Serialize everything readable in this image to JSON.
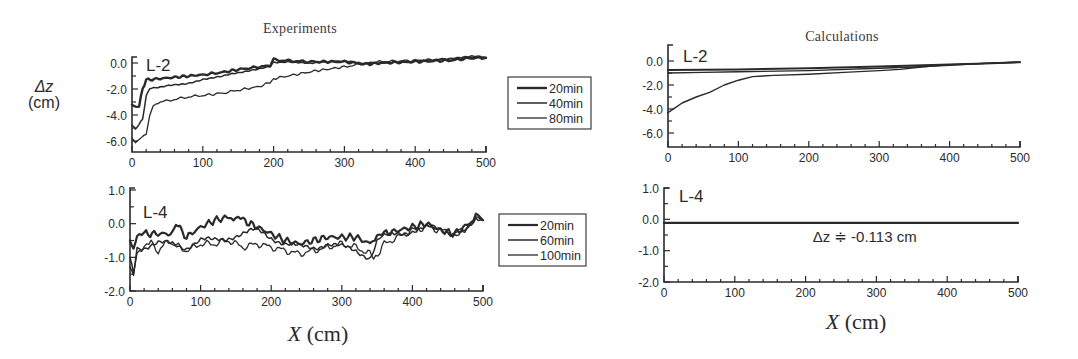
{
  "figure": {
    "columns": [
      {
        "title": "Experiments"
      },
      {
        "title": "Calculations"
      }
    ],
    "ylabel": {
      "var": "Δz",
      "unit": "(cm)"
    },
    "xlabel": {
      "var": "X",
      "unit": " (cm)"
    },
    "ink_color": "#2a2a2a"
  },
  "chart_data": [
    {
      "id": "exp-L2",
      "type": "line",
      "title": "Experiments",
      "panel_label": "L-2",
      "xlabel": "X (cm)",
      "ylabel": "Δz (cm)",
      "xlim": [
        0,
        500
      ],
      "ylim": [
        -7,
        0.4
      ],
      "xticks": [
        0,
        100,
        200,
        300,
        400,
        500
      ],
      "yticks": [
        0.0,
        -2.0,
        -4.0,
        -6.0
      ],
      "ytick_labels": [
        "0.0",
        "-2.0",
        "-4.0",
        "-6.0"
      ],
      "grid": false,
      "legend": {
        "position": "right-outside",
        "entries": [
          "20min",
          "40min",
          "80min"
        ]
      },
      "series": [
        {
          "name": "20min",
          "width": 2.4,
          "x": [
            0,
            5,
            10,
            15,
            20,
            40,
            60,
            80,
            100,
            130,
            150,
            180,
            195,
            200,
            210,
            250,
            300,
            330,
            350,
            400,
            450,
            480,
            500
          ],
          "y": [
            -3.2,
            -3.4,
            -3.3,
            -2.0,
            -1.3,
            -1.2,
            -1.1,
            -1.0,
            -0.9,
            -0.7,
            -0.5,
            -0.3,
            -0.2,
            0.3,
            0.2,
            0.1,
            0.1,
            -0.1,
            0.0,
            0.1,
            0.2,
            0.4,
            0.4
          ]
        },
        {
          "name": "40min",
          "width": 1.5,
          "x": [
            0,
            5,
            10,
            15,
            20,
            25,
            40,
            60,
            80,
            100,
            130,
            150,
            180,
            195,
            200,
            220,
            250,
            300,
            330,
            350,
            400,
            450,
            480,
            500
          ],
          "y": [
            -4.8,
            -5.0,
            -4.8,
            -4.3,
            -2.5,
            -2.0,
            -1.9,
            -1.7,
            -1.5,
            -1.3,
            -1.0,
            -0.8,
            -0.5,
            -0.3,
            0.1,
            0.1,
            0.0,
            0.1,
            -0.1,
            0.0,
            0.2,
            0.3,
            0.5,
            0.4
          ]
        },
        {
          "name": "80min",
          "width": 1.3,
          "x": [
            0,
            5,
            10,
            15,
            20,
            25,
            30,
            40,
            60,
            80,
            100,
            130,
            150,
            180,
            195,
            200,
            230,
            260,
            300,
            320,
            350,
            400,
            450,
            500
          ],
          "y": [
            -5.8,
            -6.1,
            -5.9,
            -5.6,
            -5.5,
            -4.0,
            -3.3,
            -3.0,
            -2.8,
            -2.6,
            -2.5,
            -2.3,
            -2.1,
            -1.8,
            -1.5,
            -1.2,
            -0.9,
            -0.6,
            -0.3,
            -0.1,
            0.1,
            0.2,
            0.3,
            0.4
          ]
        }
      ]
    },
    {
      "id": "exp-L4",
      "type": "line",
      "title": "",
      "panel_label": "L-4",
      "xlabel": "X (cm)",
      "ylabel": "",
      "xlim": [
        0,
        500
      ],
      "ylim": [
        -2,
        1
      ],
      "xticks": [
        0,
        100,
        200,
        300,
        400,
        500
      ],
      "yticks": [
        1.0,
        0.0,
        -1.0,
        -2.0
      ],
      "ytick_labels": [
        "1.0",
        "0.0",
        "-1.0",
        "-2.0"
      ],
      "grid": false,
      "legend": {
        "position": "right-outside",
        "entries": [
          "20min",
          "60min",
          "100min"
        ]
      },
      "series": [
        {
          "name": "20min",
          "width": 2.2,
          "x": [
            0,
            5,
            10,
            20,
            40,
            60,
            65,
            80,
            100,
            120,
            140,
            150,
            160,
            180,
            200,
            220,
            240,
            260,
            280,
            300,
            320,
            340,
            350,
            360,
            380,
            400,
            420,
            440,
            460,
            480,
            490,
            500
          ],
          "y": [
            -0.5,
            -0.8,
            -0.3,
            -0.3,
            -0.3,
            -0.3,
            0.0,
            -0.4,
            -0.1,
            0.1,
            0.2,
            0.2,
            0.1,
            -0.1,
            -0.3,
            -0.5,
            -0.6,
            -0.5,
            -0.4,
            -0.4,
            -0.4,
            -0.6,
            -0.3,
            -0.3,
            -0.2,
            -0.1,
            0.0,
            -0.2,
            -0.3,
            0.0,
            0.3,
            0.1
          ]
        },
        {
          "name": "60min",
          "width": 1.5,
          "x": [
            0,
            5,
            10,
            20,
            40,
            60,
            80,
            100,
            120,
            140,
            160,
            180,
            200,
            220,
            240,
            260,
            280,
            300,
            320,
            340,
            350,
            360,
            380,
            400,
            420,
            440,
            460,
            480,
            490,
            500
          ],
          "y": [
            -1.0,
            -1.4,
            -0.8,
            -0.7,
            -0.6,
            -0.6,
            -0.7,
            -0.5,
            -0.5,
            -0.4,
            -0.3,
            -0.2,
            -0.4,
            -0.6,
            -0.7,
            -0.7,
            -0.6,
            -0.7,
            -0.8,
            -1.0,
            -0.5,
            -0.4,
            -0.3,
            -0.2,
            -0.1,
            -0.2,
            -0.3,
            -0.1,
            0.2,
            0.1
          ]
        },
        {
          "name": "100min",
          "width": 1.3,
          "x": [
            0,
            5,
            10,
            20,
            30,
            40,
            50,
            60,
            80,
            100,
            120,
            140,
            160,
            180,
            200,
            220,
            240,
            260,
            280,
            300,
            320,
            340,
            345,
            360,
            380,
            400,
            420,
            440,
            460,
            480,
            490,
            500
          ],
          "y": [
            -1.3,
            -1.5,
            -0.9,
            -0.7,
            -0.5,
            -0.9,
            -0.5,
            -0.6,
            -0.8,
            -0.6,
            -0.6,
            -0.5,
            -0.7,
            -0.6,
            -0.7,
            -0.8,
            -0.9,
            -0.8,
            -0.7,
            -0.6,
            -0.7,
            -0.9,
            -1.1,
            -0.6,
            -0.4,
            -0.2,
            -0.1,
            -0.2,
            -0.3,
            -0.1,
            0.2,
            0.1
          ]
        }
      ]
    },
    {
      "id": "calc-L2",
      "type": "line",
      "title": "Calculations",
      "panel_label": "L-2",
      "xlabel": "X (cm)",
      "ylabel": "",
      "xlim": [
        0,
        500
      ],
      "ylim": [
        -7,
        1.3
      ],
      "xticks": [
        0,
        100,
        200,
        300,
        400,
        500
      ],
      "yticks": [
        0.0,
        -2.0,
        -4.0,
        -6.0
      ],
      "ytick_labels": [
        "0.0",
        "-2.0",
        "-4.0",
        "-6.0"
      ],
      "grid": false,
      "legend": null,
      "series": [
        {
          "name": "20min",
          "width": 2.0,
          "x": [
            0,
            100,
            200,
            300,
            400,
            450,
            500
          ],
          "y": [
            -0.75,
            -0.7,
            -0.6,
            -0.45,
            -0.3,
            -0.2,
            -0.1
          ]
        },
        {
          "name": "40min",
          "width": 1.4,
          "x": [
            0,
            50,
            100,
            200,
            300,
            350,
            400,
            450,
            500
          ],
          "y": [
            -1.0,
            -0.95,
            -0.9,
            -0.8,
            -0.6,
            -0.5,
            -0.35,
            -0.2,
            -0.1
          ]
        },
        {
          "name": "80min",
          "width": 1.4,
          "x": [
            0,
            10,
            20,
            40,
            60,
            80,
            100,
            120,
            150,
            200,
            250,
            300,
            330,
            360,
            400,
            450,
            500
          ],
          "y": [
            -4.3,
            -3.9,
            -3.5,
            -3.0,
            -2.6,
            -2.0,
            -1.6,
            -1.3,
            -1.2,
            -1.1,
            -0.95,
            -0.8,
            -0.7,
            -0.5,
            -0.3,
            -0.2,
            -0.1
          ]
        }
      ]
    },
    {
      "id": "calc-L4",
      "type": "line",
      "title": "",
      "panel_label": "L-4",
      "xlabel": "X (cm)",
      "ylabel": "",
      "xlim": [
        0,
        500
      ],
      "ylim": [
        -2,
        1
      ],
      "xticks": [
        0,
        100,
        200,
        300,
        400,
        500
      ],
      "yticks": [
        1.0,
        0.0,
        -1.0,
        -2.0
      ],
      "ytick_labels": [
        "1.0",
        "0.0",
        "-1.0",
        "-2.0"
      ],
      "grid": false,
      "legend": null,
      "annotations": [
        {
          "text": "Δz ≑ -0.113 cm",
          "x": 210,
          "y": -0.55
        }
      ],
      "series": [
        {
          "name": "all",
          "width": 2.2,
          "x": [
            0,
            500
          ],
          "y": [
            -0.113,
            -0.113
          ]
        }
      ]
    }
  ]
}
